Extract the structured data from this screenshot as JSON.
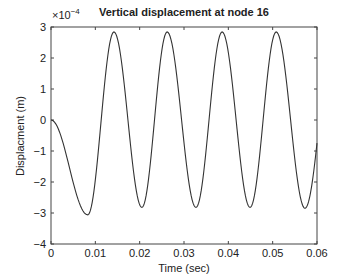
{
  "chart_data": {
    "type": "line",
    "title": "Vertical displacement at node 16",
    "xlabel": "Time (sec)",
    "ylabel": "Displacment (m)",
    "y_exponent_label": "×10",
    "y_exponent": "−4",
    "xlim": [
      0,
      0.06
    ],
    "ylim": [
      -4,
      3
    ],
    "y_scale_factor": 0.0001,
    "xticks": [
      0,
      0.01,
      0.02,
      0.03,
      0.04,
      0.05,
      0.06
    ],
    "xtick_labels": [
      "0",
      "0.01",
      "0.02",
      "0.03",
      "0.04",
      "0.05",
      "0.06"
    ],
    "yticks": [
      -4,
      -3,
      -2,
      -1,
      0,
      1,
      2,
      3
    ],
    "ytick_labels": [
      "−4",
      "−3",
      "−2",
      "−1",
      "0",
      "1",
      "2",
      "3"
    ],
    "grid": false,
    "legend": null,
    "series": [
      {
        "name": "Vertical displacement",
        "color": "#333333",
        "keypoints": {
          "x": [
            0,
            0.0083,
            0.0142,
            0.0205,
            0.0262,
            0.0327,
            0.0386,
            0.0449,
            0.0508,
            0.0573,
            0.06
          ],
          "y": [
            0,
            -3.06,
            2.84,
            -2.82,
            2.84,
            -2.82,
            2.84,
            -2.82,
            2.84,
            -2.85,
            -0.3
          ]
        }
      }
    ]
  }
}
